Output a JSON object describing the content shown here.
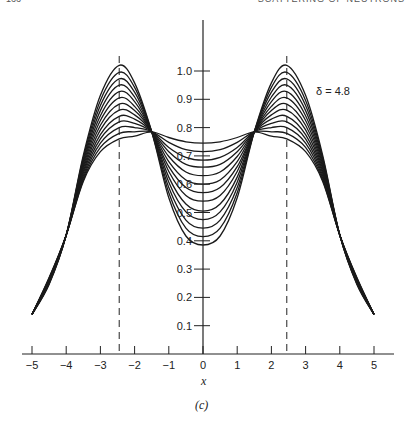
{
  "page": {
    "header_left": "166",
    "header_right": "SCATTERING OF NEUTRONS"
  },
  "chart_data": {
    "type": "line",
    "title": "",
    "panel_label": "(c)",
    "xlabel": "x",
    "ylabel": "",
    "xlim": [
      -5,
      5
    ],
    "ylim": [
      0,
      1.05
    ],
    "grid": false,
    "annotation": "δ = 4.8",
    "x_ticks": [
      "-5",
      "-4",
      "-3",
      "-2",
      "-1",
      "0",
      "1",
      "2",
      "3",
      "4",
      "5"
    ],
    "y_ticks": [
      "0.1",
      "0.2",
      "0.3",
      "0.4",
      "0.5",
      "0.6",
      "0.7",
      "0.8",
      "0.9",
      "1.0"
    ],
    "dashed_lines_x": [
      -2.45,
      2.45
    ],
    "x": [
      0,
      0.5,
      1.0,
      1.5,
      2.0,
      2.45,
      3.0,
      3.5,
      4.0,
      4.5,
      5.0
    ],
    "series": [
      {
        "name": "curve-1",
        "values": [
          0.745,
          0.75,
          0.765,
          0.785,
          0.77,
          0.76,
          0.715,
          0.61,
          0.42,
          0.27,
          0.14
        ]
      },
      {
        "name": "curve-2",
        "values": [
          0.715,
          0.722,
          0.748,
          0.785,
          0.785,
          0.78,
          0.73,
          0.615,
          0.42,
          0.268,
          0.14
        ]
      },
      {
        "name": "curve-3",
        "values": [
          0.685,
          0.695,
          0.73,
          0.785,
          0.8,
          0.8,
          0.745,
          0.622,
          0.42,
          0.266,
          0.14
        ]
      },
      {
        "name": "curve-4",
        "values": [
          0.66,
          0.67,
          0.715,
          0.785,
          0.815,
          0.82,
          0.76,
          0.63,
          0.42,
          0.264,
          0.14
        ]
      },
      {
        "name": "curve-5",
        "values": [
          0.63,
          0.643,
          0.698,
          0.785,
          0.83,
          0.84,
          0.775,
          0.638,
          0.42,
          0.262,
          0.14
        ]
      },
      {
        "name": "curve-6",
        "values": [
          0.6,
          0.615,
          0.68,
          0.785,
          0.845,
          0.862,
          0.792,
          0.646,
          0.42,
          0.26,
          0.14
        ]
      },
      {
        "name": "curve-7",
        "values": [
          0.57,
          0.588,
          0.662,
          0.785,
          0.86,
          0.883,
          0.808,
          0.654,
          0.42,
          0.258,
          0.14
        ]
      },
      {
        "name": "curve-8",
        "values": [
          0.54,
          0.56,
          0.645,
          0.785,
          0.875,
          0.905,
          0.825,
          0.662,
          0.42,
          0.256,
          0.14
        ]
      },
      {
        "name": "curve-9",
        "values": [
          0.505,
          0.53,
          0.625,
          0.785,
          0.892,
          0.927,
          0.842,
          0.67,
          0.42,
          0.254,
          0.14
        ]
      },
      {
        "name": "curve-10",
        "values": [
          0.475,
          0.502,
          0.607,
          0.785,
          0.908,
          0.95,
          0.86,
          0.678,
          0.42,
          0.252,
          0.14
        ]
      },
      {
        "name": "curve-11",
        "values": [
          0.445,
          0.473,
          0.588,
          0.785,
          0.925,
          0.972,
          0.878,
          0.686,
          0.42,
          0.25,
          0.14
        ]
      },
      {
        "name": "curve-12",
        "values": [
          0.415,
          0.445,
          0.57,
          0.785,
          0.942,
          0.995,
          0.896,
          0.694,
          0.42,
          0.248,
          0.14
        ]
      },
      {
        "name": "curve-13",
        "values": [
          0.385,
          0.417,
          0.552,
          0.785,
          0.958,
          1.02,
          0.914,
          0.702,
          0.42,
          0.246,
          0.14
        ]
      }
    ],
    "symmetric_about_x0": true
  }
}
